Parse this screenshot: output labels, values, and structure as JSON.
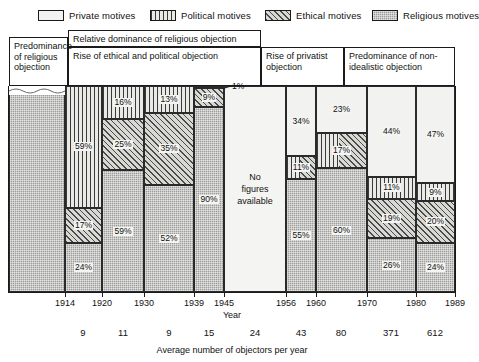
{
  "legend": {
    "items": [
      {
        "label": "Private motives",
        "key": "private",
        "swatch": "pat-private",
        "x": 38
      },
      {
        "label": "Political motives",
        "key": "political",
        "swatch": "pat-political",
        "x": 150
      },
      {
        "label": "Ethical motives",
        "key": "ethical",
        "swatch": "pat-ethical",
        "x": 265
      },
      {
        "label": "Religious motives",
        "key": "religious",
        "swatch": "pat-religious",
        "x": 372
      }
    ]
  },
  "headers": [
    {
      "name": "header-predominance-religious",
      "text": "Predominance of religious objection",
      "x": 9,
      "y": 37,
      "w": 59,
      "h": 49
    },
    {
      "name": "header-relative-dominance",
      "text": "Relative dominance of religious objection",
      "x": 68,
      "y": 30,
      "w": 193,
      "h": 17
    },
    {
      "name": "header-rise-ethical-political",
      "text": "Rise of ethical and political objection",
      "x": 68,
      "y": 47,
      "w": 193,
      "h": 39
    },
    {
      "name": "header-rise-privatist",
      "text": "Rise of privatist objection",
      "x": 261,
      "y": 47,
      "w": 83,
      "h": 39
    },
    {
      "name": "header-predominance-non-idealistic",
      "text": "Predominance of non-idealistic objection",
      "x": 344,
      "y": 47,
      "w": 111,
      "h": 39
    }
  ],
  "chart_data": {
    "type": "bar",
    "subtype": "100% stacked column, variable column width",
    "title": "",
    "xlabel": "Year",
    "secondary_xlabel": "Average number of objectors per year",
    "ylabel": "",
    "ylim": [
      0,
      100
    ],
    "grid": false,
    "legend_position": "top",
    "series": [
      {
        "name": "Private motives",
        "key": "private"
      },
      {
        "name": "Political motives",
        "key": "political"
      },
      {
        "name": "Ethical motives",
        "key": "ethical"
      },
      {
        "name": "Religious motives",
        "key": "religious"
      }
    ],
    "note": "No figures available",
    "columns": [
      {
        "period": "pre-1914",
        "year_start": null,
        "year_end": 1914,
        "x": 0,
        "w": 56,
        "truncated_top": true,
        "objectors_per_year": null,
        "stack": [
          {
            "key": "religious",
            "value": 100,
            "label": "",
            "show": false
          }
        ]
      },
      {
        "period": "1914-1920",
        "year_start": 1914,
        "year_end": 1920,
        "x": 56,
        "w": 37,
        "objectors_per_year": 9,
        "stack": [
          {
            "key": "political",
            "value": 59,
            "label": "59%",
            "show": true
          },
          {
            "key": "ethical",
            "value": 17,
            "label": "17%",
            "show": true
          },
          {
            "key": "religious",
            "value": 24,
            "label": "24%",
            "show": true
          }
        ]
      },
      {
        "period": "1920-1930",
        "year_start": 1920,
        "year_end": 1930,
        "x": 93,
        "w": 42,
        "objectors_per_year": 11,
        "stack": [
          {
            "key": "political",
            "value": 16,
            "label": "16%",
            "show": true
          },
          {
            "key": "ethical",
            "value": 25,
            "label": "25%",
            "show": true
          },
          {
            "key": "religious",
            "value": 59,
            "label": "59%",
            "show": true
          }
        ]
      },
      {
        "period": "1930-1939",
        "year_start": 1930,
        "year_end": 1939,
        "x": 135,
        "w": 50,
        "objectors_per_year": 9,
        "stack": [
          {
            "key": "political",
            "value": 13,
            "label": "13%",
            "show": true
          },
          {
            "key": "ethical",
            "value": 35,
            "label": "35%",
            "show": true
          },
          {
            "key": "religious",
            "value": 52,
            "label": "52%",
            "show": true
          }
        ]
      },
      {
        "period": "1939-1945",
        "year_start": 1939,
        "year_end": 1945,
        "x": 185,
        "w": 30,
        "objectors_per_year": 15,
        "stack": [
          {
            "key": "political",
            "value": 1,
            "label": "1%",
            "show": false,
            "callout": true
          },
          {
            "key": "ethical",
            "value": 9,
            "label": "9%",
            "show": true
          },
          {
            "key": "religious",
            "value": 90,
            "label": "90%",
            "show": true
          }
        ]
      },
      {
        "period": "1945-1956",
        "year_start": 1945,
        "year_end": 1956,
        "x": 215,
        "w": 62,
        "objectors_per_year": 24,
        "no_figures": true,
        "stack": []
      },
      {
        "period": "1956-1960",
        "year_start": 1956,
        "year_end": 1960,
        "x": 277,
        "w": 30,
        "objectors_per_year": 43,
        "stack": [
          {
            "key": "private",
            "value": 34,
            "label": "34%",
            "show": true
          },
          {
            "key": "political_ethical",
            "value": 11,
            "label": "11%",
            "show": true
          },
          {
            "key": "religious",
            "value": 55,
            "label": "55%",
            "show": true
          }
        ]
      },
      {
        "period": "1960-1970",
        "year_start": 1960,
        "year_end": 1970,
        "x": 307,
        "w": 51,
        "objectors_per_year": 80,
        "stack": [
          {
            "key": "private",
            "value": 23,
            "label": "23%",
            "show": true
          },
          {
            "key": "political_ethical",
            "value": 17,
            "label": "17%",
            "show": true
          },
          {
            "key": "religious",
            "value": 60,
            "label": "60%",
            "show": true
          }
        ]
      },
      {
        "period": "1970-1980",
        "year_start": 1970,
        "year_end": 1980,
        "x": 358,
        "w": 49,
        "objectors_per_year": 371,
        "stack": [
          {
            "key": "private",
            "value": 44,
            "label": "44%",
            "show": true
          },
          {
            "key": "political",
            "value": 11,
            "label": "11%",
            "show": true
          },
          {
            "key": "ethical",
            "value": 19,
            "label": "19%",
            "show": true
          },
          {
            "key": "religious",
            "value": 26,
            "label": "26%",
            "show": true
          }
        ]
      },
      {
        "period": "1980-1989",
        "year_start": 1980,
        "year_end": 1989,
        "x": 407,
        "w": 39,
        "objectors_per_year": 612,
        "stack": [
          {
            "key": "private",
            "value": 47,
            "label": "47%",
            "show": true
          },
          {
            "key": "political",
            "value": 9,
            "label": "9%",
            "show": true
          },
          {
            "key": "ethical",
            "value": 20,
            "label": "20%",
            "show": true
          },
          {
            "key": "religious",
            "value": 24,
            "label": "24%",
            "show": true
          }
        ]
      }
    ],
    "x_ticks": [
      {
        "label": "1914",
        "x": 56
      },
      {
        "label": "1920",
        "x": 93
      },
      {
        "label": "1930",
        "x": 135
      },
      {
        "label": "1939",
        "x": 185
      },
      {
        "label": "1945",
        "x": 215
      },
      {
        "label": "1956",
        "x": 277
      },
      {
        "label": "1960",
        "x": 307
      },
      {
        "label": "1970",
        "x": 358
      },
      {
        "label": "1980",
        "x": 407
      },
      {
        "label": "1989",
        "x": 446
      }
    ],
    "objector_numbers": [
      {
        "label": "9",
        "x": 74
      },
      {
        "label": "11",
        "x": 114
      },
      {
        "label": "9",
        "x": 160
      },
      {
        "label": "15",
        "x": 200
      },
      {
        "label": "24",
        "x": 246
      },
      {
        "label": "43",
        "x": 292
      },
      {
        "label": "80",
        "x": 332
      },
      {
        "label": "371",
        "x": 382
      },
      {
        "label": "612",
        "x": 426
      }
    ]
  }
}
